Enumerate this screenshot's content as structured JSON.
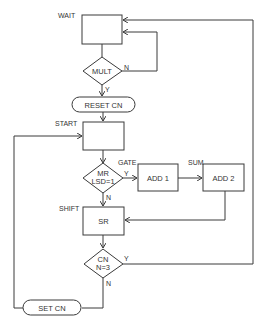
{
  "diagram": {
    "type": "flowchart",
    "colors": {
      "line": "#3a3a3a",
      "background": "#ffffff",
      "text": "#333333"
    },
    "nodes": {
      "wait": {
        "label": "",
        "tag": "WAIT",
        "shape": "rectangle"
      },
      "mult": {
        "label": "MULT",
        "shape": "diamond"
      },
      "reset_cn": {
        "label": "RESET CN",
        "shape": "terminal"
      },
      "start": {
        "label": "",
        "tag": "START",
        "shape": "rectangle"
      },
      "mr_lsd": {
        "line1": "MR",
        "line2": "LSD=1",
        "shape": "diamond"
      },
      "add1": {
        "label": "ADD 1",
        "tag": "GATE",
        "shape": "rectangle"
      },
      "add2": {
        "label": "ADD 2",
        "tag": "SUM",
        "shape": "rectangle"
      },
      "sr": {
        "label": "SR",
        "tag": "SHIFT",
        "shape": "rectangle"
      },
      "cn_n3": {
        "line1": "CN",
        "line2": "N=3",
        "shape": "diamond"
      },
      "set_cn": {
        "label": "SET CN",
        "shape": "terminal"
      }
    },
    "edge_labels": {
      "mult_no": "N",
      "mult_yes": "Y",
      "mr_yes": "Y",
      "mr_no": "N",
      "cn_yes": "Y",
      "cn_no": "N"
    }
  }
}
